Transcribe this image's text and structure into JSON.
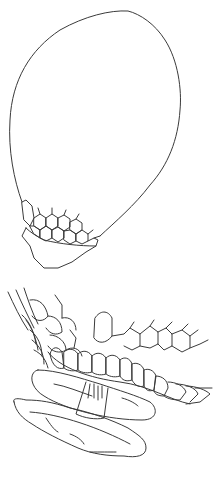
{
  "illustration": {
    "style": "botanical line drawing, black ink on white",
    "colors": {
      "background": "#ffffff",
      "stroke": "#3a3a3a"
    },
    "figures": [
      {
        "id": "capsule",
        "description": "ovoid capsule with honeycomb-celled annulus and truncated base"
      },
      {
        "id": "peristome-detail",
        "description": "enlarged detail of ribbed annulus, operculum-like disc with column and fringed lower disc"
      }
    ]
  }
}
